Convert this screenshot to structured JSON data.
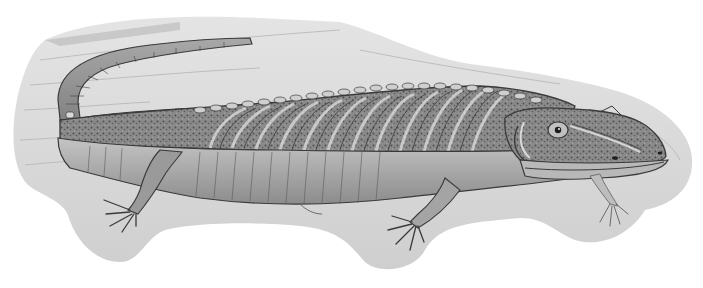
{
  "image": {
    "subject": "prehistoric amphibian illustration",
    "style": "grayscale pencil drawing",
    "colors": {
      "background": "#ffffff",
      "backdrop": "#d4d4d4",
      "backdrop_light": "#e2e2e2",
      "body_mid": "#9a9a9a",
      "body_dark": "#555555",
      "belly": "#b8b8b8",
      "outline": "#3a3a3a"
    }
  }
}
